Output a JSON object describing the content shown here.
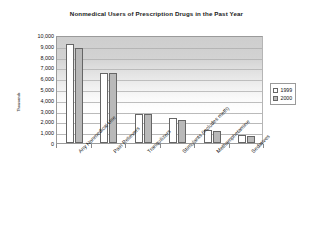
{
  "chart_data": {
    "type": "bar",
    "title": "Nonmedical Users of Prescription Drugs in the Past Year",
    "xlabel": "",
    "ylabel": "Thousands",
    "ylim": [
      0,
      10000
    ],
    "ytick_step": 1000,
    "ytick_labels": [
      "10,000",
      "9,000",
      "8,000",
      "7,000",
      "6,000",
      "5,000",
      "4,000",
      "3,000",
      "2,000",
      "1,000",
      "0"
    ],
    "ytick_values": [
      10000,
      9000,
      8000,
      7000,
      6000,
      5000,
      4000,
      3000,
      2000,
      1000,
      0
    ],
    "grid": true,
    "legend_position": "right",
    "categories": [
      "Any Nonmedical Use",
      "Pain Relievers",
      "Tranquilizers",
      "Stimulants (includes meth)",
      "Methamphetamine",
      "Sedatives"
    ],
    "series": [
      {
        "name": "1999",
        "color": "#ffffff",
        "values": [
          9200,
          6500,
          2700,
          2300,
          1200,
          700
        ]
      },
      {
        "name": "2000",
        "color": "#b9b9b9",
        "values": [
          8800,
          6450,
          2700,
          2100,
          1100,
          650
        ]
      }
    ]
  },
  "legend": {
    "entries": [
      {
        "label": "1999",
        "swatch": "series-1999-swatch"
      },
      {
        "label": "2000",
        "swatch": "series-2000-swatch"
      }
    ]
  }
}
